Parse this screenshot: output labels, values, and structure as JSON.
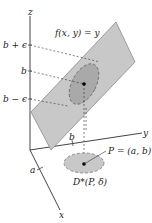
{
  "diagram": {
    "function_label": "f(x, y) = y",
    "axes": {
      "x": "x",
      "y": "y",
      "z": "z"
    },
    "z_ticks": {
      "upper": "b + ϵ",
      "middle": "b",
      "lower": "b − ϵ"
    },
    "x_tick": "a",
    "y_tick": "b",
    "point_label": "P = (a, b)",
    "disk_label": "D*(P, δ)",
    "colors": {
      "plane": "#c8c8c8",
      "plane_edge": "#8a8a8a",
      "ellipse": "#a9a9a9",
      "axis": "#444444",
      "point": "#000000"
    }
  }
}
